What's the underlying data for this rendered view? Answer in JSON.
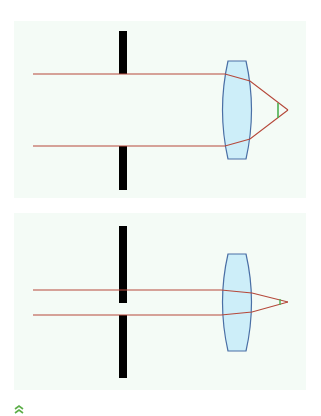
{
  "colors": {
    "background": "#ffffff",
    "panel_bg": "#f4fbf6",
    "ray": "#b5483a",
    "barrier": "#000000",
    "lens_fill": "#cdeef9",
    "lens_stroke": "#4a6fa5",
    "angle_marker": "#4caf50",
    "chevron": "#5cae48"
  },
  "diagrams": [
    {
      "id": "wide-aperture",
      "description": "Wide aperture: parallel rays far apart, large convergence angle"
    },
    {
      "id": "narrow-aperture",
      "description": "Narrow aperture: parallel rays close together, small convergence angle"
    }
  ],
  "footer": {
    "icon": "double-chevron-up-icon"
  }
}
